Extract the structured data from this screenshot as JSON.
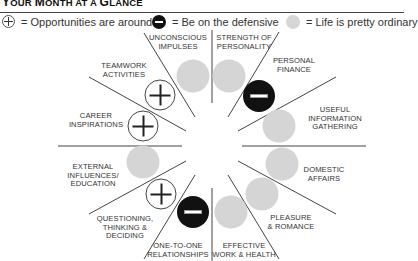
{
  "header": {
    "title_first": "Y",
    "title_rest": "OUR ",
    "title_m": "M",
    "title_onth": "ONTH AT A ",
    "title_g": "G",
    "title_lance": "LANCE"
  },
  "legend": {
    "opportunity": "= Opportunities are around",
    "defensive": "= Be on the defensive",
    "ordinary": "= Life is pretty ordinary"
  },
  "colors": {
    "ordinary_grey": "#d5d5d5",
    "defensive_black": "#111111",
    "line": "#444444"
  },
  "sectors": [
    {
      "id": "unconscious-impulses",
      "lines": [
        "UNCONSCIOUS",
        "IMPULSES"
      ],
      "status": "ordinary"
    },
    {
      "id": "strength-of-personality",
      "lines": [
        "STRENGTH OF",
        "PERSONALITY"
      ],
      "status": "ordinary"
    },
    {
      "id": "personal-finance",
      "lines": [
        "PERSONAL",
        "FINANCE"
      ],
      "status": "defensive"
    },
    {
      "id": "useful-information-gathering",
      "lines": [
        "USEFUL",
        "INFORMATION",
        "GATHERING"
      ],
      "status": "ordinary"
    },
    {
      "id": "domestic-affairs",
      "lines": [
        "DOMESTIC",
        "AFFAIRS"
      ],
      "status": "ordinary"
    },
    {
      "id": "pleasure-romance",
      "lines": [
        "PLEASURE",
        "& ROMANCE"
      ],
      "status": "ordinary"
    },
    {
      "id": "effective-work-health",
      "lines": [
        "EFFECTIVE",
        "WORK & HEALTH"
      ],
      "status": "ordinary"
    },
    {
      "id": "one-to-one-relationships",
      "lines": [
        "ONE-TO-ONE",
        "RELATIONSHIPS"
      ],
      "status": "defensive"
    },
    {
      "id": "questioning-thinking-deciding",
      "lines": [
        "QUESTIONING,",
        "THINKING &",
        "DECIDING"
      ],
      "status": "opportunity"
    },
    {
      "id": "external-influences-education",
      "lines": [
        "EXTERNAL",
        "INFLUENCES/",
        "EDUCATION"
      ],
      "status": "ordinary"
    },
    {
      "id": "career-inspirations",
      "lines": [
        "CAREER",
        "INSPIRATIONS"
      ],
      "status": "opportunity"
    },
    {
      "id": "teamwork-activities",
      "lines": [
        "TEAMWORK",
        "ACTIVITIES"
      ],
      "status": "opportunity"
    }
  ]
}
